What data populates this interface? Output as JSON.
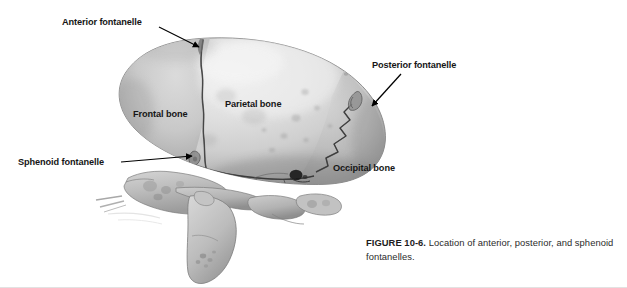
{
  "figure": {
    "caption_number": "FIGURE 10-6.",
    "caption_text": "Location of anterior, posterior, and sphenoid fontanelles.",
    "image_name": "infant-skull-lateral-3d-ct"
  },
  "annotations": [
    {
      "id": "anterior-fontanelle",
      "label": "Anterior fontanelle",
      "x": 62,
      "y": 17,
      "leader": {
        "type": "arrow",
        "x1": 159,
        "y1": 27,
        "x2": 199,
        "y2": 47
      }
    },
    {
      "id": "frontal-bone",
      "label": "Frontal bone",
      "x": 133,
      "y": 109,
      "leader": null
    },
    {
      "id": "parietal-bone",
      "label": "Parietal bone",
      "x": 225,
      "y": 99,
      "leader": null
    },
    {
      "id": "posterior-fontanelle",
      "label": "Posterior fontanelle",
      "x": 372,
      "y": 60,
      "leader": {
        "type": "arrow",
        "x1": 401,
        "y1": 74,
        "x2": 372,
        "y2": 106
      }
    },
    {
      "id": "occipital-bone",
      "label": "Occipital bone",
      "x": 333,
      "y": 163,
      "leader": null
    },
    {
      "id": "sphenoid-fontanelle",
      "label": "Sphenoid fontanelle",
      "x": 18,
      "y": 157,
      "leader": {
        "type": "arrow",
        "x1": 121,
        "y1": 162,
        "x2": 192,
        "y2": 156
      }
    }
  ],
  "colors": {
    "background": "#ffffff",
    "label_text": "#161616",
    "caption_text": "#2b2b2b",
    "leader_line": "#000000",
    "bone_light": "#dcdcdc",
    "bone_mid": "#bfbfbf",
    "bone_shadow": "#8e8e8e",
    "suture_dark": "#4a4a4a"
  }
}
